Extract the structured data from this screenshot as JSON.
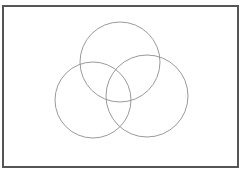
{
  "diagram": {
    "type": "venn",
    "background": "#ffffff",
    "frame": {
      "x": 3,
      "y": 6,
      "width": 235,
      "height": 161,
      "stroke": "#555555",
      "stroke_width": 2
    },
    "circles": [
      {
        "id": "top",
        "cx": 120,
        "cy": 62,
        "r": 40,
        "stroke": "#9a9a9a",
        "stroke_width": 1
      },
      {
        "id": "left",
        "cx": 93,
        "cy": 100,
        "r": 38,
        "stroke": "#9a9a9a",
        "stroke_width": 1
      },
      {
        "id": "right",
        "cx": 147,
        "cy": 96,
        "r": 41,
        "stroke": "#9a9a9a",
        "stroke_width": 1
      }
    ],
    "labels": []
  }
}
